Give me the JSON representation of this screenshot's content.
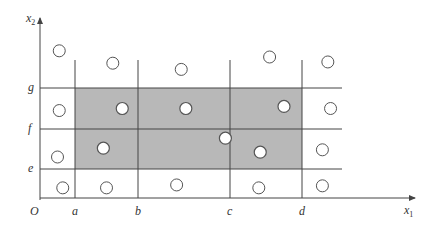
{
  "diagram": {
    "axes": {
      "x_label": "x",
      "x_subscript": "1",
      "y_label": "x",
      "y_subscript": "2",
      "origin_label": "O"
    },
    "x_ticks": [
      {
        "label": "a",
        "value": 1
      },
      {
        "label": "b",
        "value": 2
      },
      {
        "label": "c",
        "value": 3
      },
      {
        "label": "d",
        "value": 4
      }
    ],
    "y_ticks": [
      {
        "label": "e",
        "value": 1
      },
      {
        "label": "f",
        "value": 2
      },
      {
        "label": "g",
        "value": 3
      }
    ],
    "shaded_region": {
      "x_from": "a",
      "x_to": "d",
      "y_from": "e",
      "y_to": "g",
      "color": "#b8b8b8"
    },
    "points_outside": [
      {
        "x": 0.55,
        "y": 3.6
      },
      {
        "x": 1.6,
        "y": 3.4
      },
      {
        "x": 2.47,
        "y": 3.3
      },
      {
        "x": 3.55,
        "y": 3.5
      },
      {
        "x": 4.38,
        "y": 3.42
      },
      {
        "x": 0.55,
        "y": 2.45
      },
      {
        "x": 4.42,
        "y": 2.5
      },
      {
        "x": 0.5,
        "y": 1.3
      },
      {
        "x": 4.3,
        "y": 1.48
      },
      {
        "x": 0.65,
        "y": 0.35
      },
      {
        "x": 1.5,
        "y": 0.35
      },
      {
        "x": 2.42,
        "y": 0.45
      },
      {
        "x": 3.4,
        "y": 0.35
      },
      {
        "x": 4.3,
        "y": 0.42
      }
    ],
    "points_inside": [
      {
        "x": 1.75,
        "y": 2.5
      },
      {
        "x": 2.52,
        "y": 2.5
      },
      {
        "x": 3.75,
        "y": 2.55
      },
      {
        "x": 1.45,
        "y": 1.52
      },
      {
        "x": 2.95,
        "y": 1.77
      },
      {
        "x": 3.42,
        "y": 1.42
      }
    ],
    "colors": {
      "line": "#444444",
      "shade": "#b8b8b8",
      "circle_stroke": "#555555"
    }
  }
}
